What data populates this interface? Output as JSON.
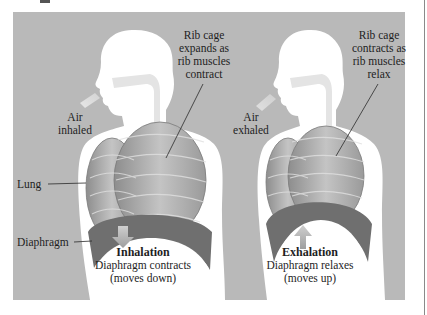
{
  "figure": {
    "panel_color": "#b9b9b9",
    "body_color": "#ffffff",
    "lung_color": "#9a9a9a",
    "inhalation": {
      "rib_label": [
        "Rib cage",
        "expands as",
        "rib muscles",
        "contract"
      ],
      "air_label": [
        "Air",
        "inhaled"
      ],
      "lung_label": "Lung",
      "diaphragm_label": "Diaphragm",
      "title": "Inhalation",
      "caption_line1": "Diaphragm contracts",
      "caption_line2": "(moves down)",
      "arrow_direction": "down"
    },
    "exhalation": {
      "rib_label": [
        "Rib cage",
        "contracts as",
        "rib muscles",
        "relax"
      ],
      "air_label": [
        "Air",
        "exhaled"
      ],
      "title": "Exhalation",
      "caption_line1": "Diaphragm relaxes",
      "caption_line2": "(moves up)",
      "arrow_direction": "up"
    }
  }
}
